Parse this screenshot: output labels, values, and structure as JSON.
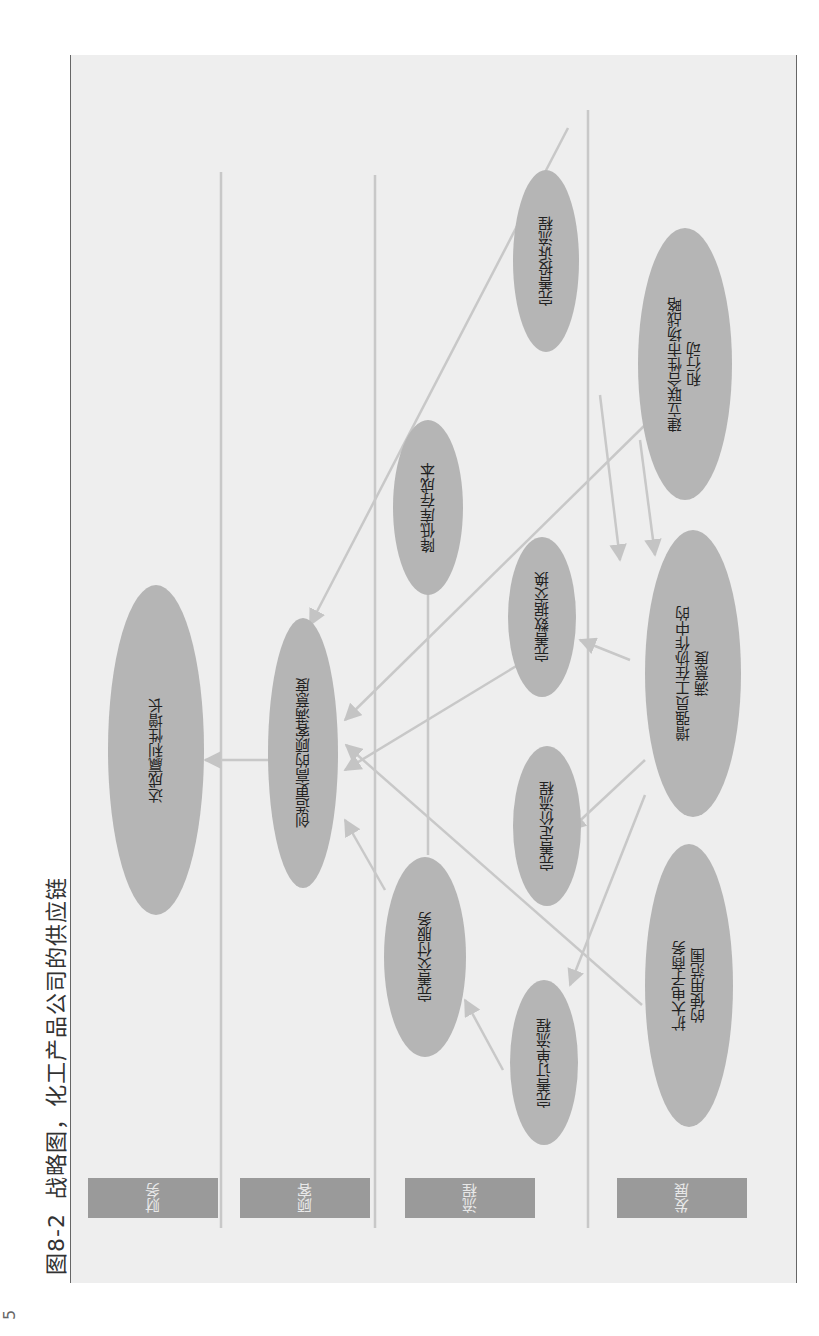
{
  "caption": {
    "number": "图8-2",
    "title": "战略图，化工产品公司的供应链"
  },
  "page_number": "5",
  "lanes": [
    {
      "id": "finance",
      "label": "财务"
    },
    {
      "id": "customer",
      "label": "顾客"
    },
    {
      "id": "process",
      "label": "流程"
    },
    {
      "id": "growth",
      "label": "发展"
    }
  ],
  "nodes": [
    {
      "id": "profit_growth",
      "lane": "finance",
      "label": "达成赢利性增长"
    },
    {
      "id": "customer_satisfaction",
      "lane": "customer",
      "label": "创造更高的顾客满意度"
    },
    {
      "id": "delivery_service",
      "lane": "process",
      "label": "完善交付服务"
    },
    {
      "id": "inventory_cost",
      "lane": "process",
      "label": "降低库存成本"
    },
    {
      "id": "order_process",
      "lane": "process",
      "label": "完善订单流程"
    },
    {
      "id": "pricing_process",
      "lane": "process",
      "label": "完善定价流程"
    },
    {
      "id": "data_exchange",
      "lane": "process",
      "label": "完善数据交换"
    },
    {
      "id": "complaint_process",
      "lane": "process",
      "label": "完善投诉流程"
    },
    {
      "id": "ecommerce",
      "lane": "growth",
      "label": "扩大电子商务\n的使用范围"
    },
    {
      "id": "employee_satisfaction",
      "lane": "growth",
      "label": "增强员工在协作中的\n满意度"
    },
    {
      "id": "joint_market",
      "lane": "growth",
      "label": "建立联合性市场战略\n和行动"
    }
  ],
  "edges": [
    {
      "from": "customer_satisfaction",
      "to": "profit_growth"
    },
    {
      "from": "delivery_service",
      "to": "customer_satisfaction"
    },
    {
      "from": "inventory_cost",
      "to": "profit_growth"
    },
    {
      "from": "data_exchange",
      "to": "customer_satisfaction"
    },
    {
      "from": "complaint_process",
      "to": "customer_satisfaction"
    },
    {
      "from": "order_process",
      "to": "delivery_service"
    },
    {
      "from": "ecommerce",
      "to": "customer_satisfaction"
    },
    {
      "from": "joint_market",
      "to": "customer_satisfaction"
    },
    {
      "from": "employee_satisfaction",
      "to": "order_process"
    },
    {
      "from": "employee_satisfaction",
      "to": "pricing_process"
    },
    {
      "from": "employee_satisfaction",
      "to": "data_exchange"
    },
    {
      "from": "employee_satisfaction",
      "to": "complaint_process"
    },
    {
      "from": "joint_market",
      "to": "employee_satisfaction"
    }
  ]
}
